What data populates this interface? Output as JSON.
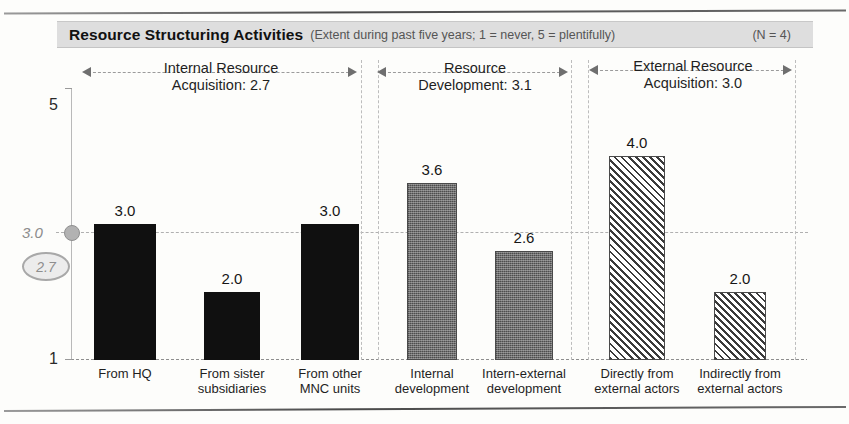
{
  "header": {
    "title": "Resource Structuring Activities",
    "subtitle": "(Extent during past five years; 1 = never, 5 = plentifully)",
    "sample_size": "(N = 4)"
  },
  "axis": {
    "y_top_label": "5",
    "y_bottom_label": "1",
    "reference_label": "3.0",
    "annotation_label": "2.7"
  },
  "groups": [
    {
      "name_line1": "Internal Resource",
      "name_line2": "Acquisition: 2.7",
      "mean": 2.7
    },
    {
      "name_line1": "Resource",
      "name_line2": "Development: 3.1",
      "mean": 3.1
    },
    {
      "name_line1": "External Resource",
      "name_line2": "Acquisition: 3.0",
      "mean": 3.0
    }
  ],
  "chart_data": {
    "type": "bar",
    "title": "Resource Structuring Activities",
    "subtitle": "(Extent during past five years; 1 = never, 5 = plentifully)",
    "xlabel": "",
    "ylabel": "",
    "ylim": [
      1,
      5
    ],
    "yticks": [
      1,
      5
    ],
    "grid": false,
    "legend": "none",
    "reference_line": 3.0,
    "annotation": 2.7,
    "n": 4,
    "categories": [
      "From HQ",
      "From sister subsidiaries",
      "From other MNC units",
      "Internal development",
      "Intern-external development",
      "Directly from external actors",
      "Indirectly from external actors"
    ],
    "category_lines": [
      [
        "From HQ",
        ""
      ],
      [
        "From sister",
        "subsidiaries"
      ],
      [
        "From other",
        "MNC units"
      ],
      [
        "Internal",
        "development"
      ],
      [
        "Intern-external",
        "development"
      ],
      [
        "Directly from",
        "external actors"
      ],
      [
        "Indirectly from",
        "external actors"
      ]
    ],
    "values": [
      3.0,
      2.0,
      3.0,
      3.6,
      2.6,
      4.0,
      2.0
    ],
    "value_labels": [
      "3.0",
      "2.0",
      "3.0",
      "3.6",
      "2.6",
      "4.0",
      "2.0"
    ],
    "group_of_bar": [
      0,
      0,
      0,
      1,
      1,
      2,
      2
    ],
    "group_names": [
      "Internal Resource Acquisition",
      "Resource Development",
      "External Resource Acquisition"
    ],
    "group_means": [
      2.7,
      3.1,
      3.0
    ],
    "fills": [
      "solid-black",
      "solid-black",
      "solid-black",
      "gray-dotted",
      "gray-dotted",
      "diagonal-hatch",
      "diagonal-hatch"
    ],
    "colors": {
      "solid-black": "#101010",
      "gray-dotted": "#6e6e6e",
      "diagonal-hatch": "#3a3a3a",
      "banner": "#dedede",
      "reference": "#b2b2b2"
    }
  }
}
